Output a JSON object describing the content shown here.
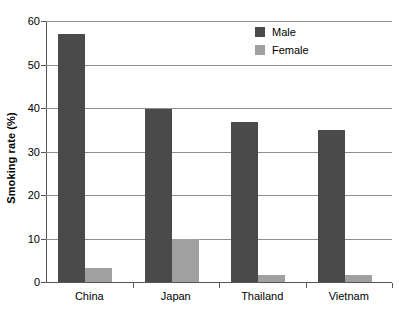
{
  "chart_data": {
    "type": "bar",
    "title": "",
    "xlabel": "",
    "ylabel": "Smoking rate (%)",
    "ylim": [
      0,
      60
    ],
    "yticks": [
      0,
      10,
      20,
      30,
      40,
      50,
      60
    ],
    "ytick_labels": [
      "0",
      "10",
      "20",
      "30",
      "40",
      "50",
      "60"
    ],
    "grid": true,
    "legend_position": "top-right",
    "categories": [
      "China",
      "Japan",
      "Thailand",
      "Vietnam"
    ],
    "series": [
      {
        "name": "Male",
        "color": "#4a4a4a",
        "values": [
          57.0,
          39.8,
          36.7,
          35.0
        ]
      },
      {
        "name": "Female",
        "color": "#a0a0a0",
        "values": [
          3.2,
          9.9,
          1.6,
          1.6
        ]
      }
    ]
  },
  "legend": {
    "items": [
      {
        "label": "Male",
        "swatch": "male-swatch"
      },
      {
        "label": "Female",
        "swatch": "female-swatch"
      }
    ]
  },
  "axes": {
    "y_title": "Smoking rate (%)"
  }
}
